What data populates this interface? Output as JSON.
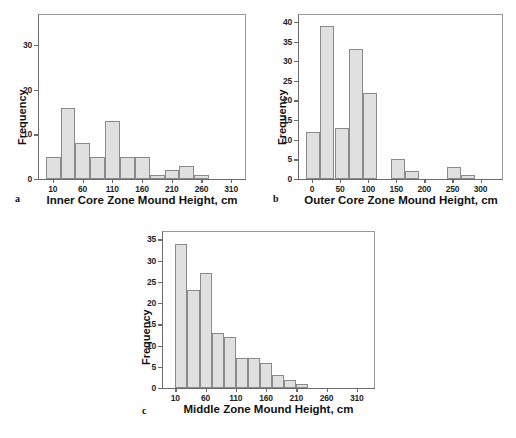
{
  "figure": {
    "background": "#ffffff",
    "bar_fill": "#e0e0e0",
    "bar_stroke": "#8a8a8a",
    "axis_color": "#6b6b6b"
  },
  "chart_data": [
    {
      "type": "bar",
      "panel": "a",
      "title": "",
      "xlabel": "Inner Core Zone Mound Height, cm",
      "ylabel": "Frequency",
      "grid": false,
      "legend": "none",
      "xlim": [
        -15,
        335
      ],
      "ylim": [
        0,
        37
      ],
      "xticks": [
        "10",
        "60",
        "110",
        "160",
        "210",
        "260",
        "310"
      ],
      "xtick_values": [
        10,
        60,
        110,
        160,
        210,
        260,
        310
      ],
      "yticks": [
        "0",
        "10",
        "20",
        "30"
      ],
      "ytick_values": [
        0,
        10,
        20,
        30
      ],
      "bin_width": 25,
      "bin_starts": [
        -2,
        23,
        48,
        73,
        98,
        123,
        148,
        173,
        198,
        223,
        248
      ],
      "values": [
        5,
        16,
        8,
        5,
        13,
        5,
        5,
        1,
        2,
        3,
        1
      ]
    },
    {
      "type": "bar",
      "panel": "b",
      "title": "",
      "xlabel": "Outer Core Zone Mound Height, cm",
      "ylabel": "Frequency",
      "grid": false,
      "legend": "none",
      "xlim": [
        -25,
        340
      ],
      "ylim": [
        0,
        42
      ],
      "xticks": [
        "0",
        "50",
        "100",
        "150",
        "200",
        "250",
        "300"
      ],
      "xtick_values": [
        0,
        50,
        100,
        150,
        200,
        250,
        300
      ],
      "yticks": [
        "0",
        "5",
        "10",
        "15",
        "20",
        "25",
        "30",
        "35",
        "40"
      ],
      "ytick_values": [
        0,
        5,
        10,
        15,
        20,
        25,
        30,
        35,
        40
      ],
      "bin_width": 25,
      "bin_starts": [
        -10,
        15,
        40,
        65,
        90,
        115,
        140,
        165,
        190,
        240,
        265
      ],
      "values": [
        12,
        39,
        13,
        33,
        22,
        0,
        5,
        2,
        0,
        3,
        1
      ]
    },
    {
      "type": "bar",
      "panel": "c",
      "title": "",
      "xlabel": "Middle Zone Mound Height, cm",
      "ylabel": "Frequency",
      "grid": false,
      "legend": "none",
      "xlim": [
        -12,
        340
      ],
      "ylim": [
        0,
        37
      ],
      "xticks": [
        "10",
        "60",
        "110",
        "160",
        "210",
        "260",
        "310"
      ],
      "xtick_values": [
        10,
        60,
        110,
        160,
        210,
        260,
        310
      ],
      "yticks": [
        "0",
        "5",
        "10",
        "15",
        "20",
        "25",
        "30",
        "35"
      ],
      "ytick_values": [
        0,
        5,
        10,
        15,
        20,
        25,
        30,
        35
      ],
      "bin_width": 20,
      "bin_starts": [
        10,
        30,
        50,
        70,
        90,
        110,
        130,
        150,
        170,
        190,
        210
      ],
      "values": [
        34,
        23,
        27,
        13,
        12,
        7,
        7,
        6,
        3,
        2,
        1
      ]
    }
  ],
  "panels": {
    "a": {
      "letter": "a",
      "xlabel": "Inner Core Zone Mound Height, cm",
      "ylabel": "Frequency"
    },
    "b": {
      "letter": "b",
      "xlabel": "Outer Core Zone Mound Height, cm",
      "ylabel": "Frequency"
    },
    "c": {
      "letter": "c",
      "xlabel": "Middle Zone Mound Height, cm",
      "ylabel": "Frequency"
    }
  }
}
